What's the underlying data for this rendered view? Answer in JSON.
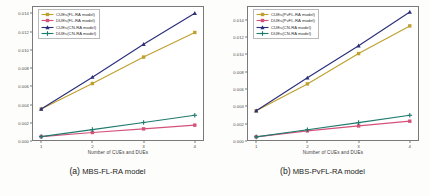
{
  "figure": {
    "background": "#fdfdfb"
  },
  "panels": [
    {
      "caption_tag": "(a)",
      "caption_name": "MBS-FL-RA model",
      "caption_full": "(a) MBS-FL-RA model",
      "chart_data": {
        "type": "line",
        "title": "",
        "xlabel": "Number of CUEs and DUEs",
        "ylabel": "Average Transmission Power (Watt)",
        "x": [
          1,
          2,
          3,
          4
        ],
        "xticklabels": [
          "1",
          "2",
          "3",
          "4"
        ],
        "yticklabels": [
          "0.000",
          "0.002",
          "0.004",
          "0.006",
          "0.008",
          "0.010",
          "0.012",
          "0.014"
        ],
        "ylim": [
          0.0,
          0.0148
        ],
        "xlim": [
          0.82,
          4.18
        ],
        "grid": false,
        "legend_position": "upper left",
        "series": [
          {
            "name": "CUEs(FL-RA model)",
            "values": [
              0.0035,
              0.0063,
              0.0092,
              0.0119
            ],
            "color": "#bfa02e",
            "marker": "square"
          },
          {
            "name": "DUEs(FL-RA model)",
            "values": [
              0.00048,
              0.00093,
              0.00133,
              0.00174
            ],
            "color": "#d4517a",
            "marker": "square"
          },
          {
            "name": "CUEs(CN-RA model)",
            "values": [
              0.0035,
              0.007,
              0.0106,
              0.014
            ],
            "color": "#2b2f7a",
            "marker": "triangle"
          },
          {
            "name": "DUEs(CN-RA model)",
            "values": [
              0.00048,
              0.00125,
              0.00203,
              0.00282
            ],
            "color": "#1f7a6e",
            "marker": "plus"
          }
        ]
      }
    },
    {
      "caption_tag": "(b)",
      "caption_name": "MBS-PvFL-RA model",
      "caption_full": "(b) MBS-PvFL-RA model",
      "chart_data": {
        "type": "line",
        "title": "",
        "xlabel": "Number of CUEs and DUEs",
        "ylabel": "Average Transmission Power (Watt)",
        "x": [
          1,
          2,
          3,
          4
        ],
        "xticklabels": [
          "1",
          "2",
          "3",
          "4"
        ],
        "yticklabels": [
          "0.000",
          "0.002",
          "0.004",
          "0.006",
          "0.008",
          "0.010",
          "0.012",
          "0.014"
        ],
        "ylim": [
          0.0,
          0.0156
        ],
        "xlim": [
          0.82,
          4.18
        ],
        "grid": false,
        "legend_position": "upper left",
        "series": [
          {
            "name": "CUEs(PvFL-RA model)",
            "values": [
              0.0035,
              0.0066,
              0.0101,
              0.0133
            ],
            "color": "#bfa02e",
            "marker": "square"
          },
          {
            "name": "DUEs(PvFL-RA model)",
            "values": [
              0.00048,
              0.00117,
              0.00174,
              0.00229
            ],
            "color": "#d4517a",
            "marker": "square"
          },
          {
            "name": "CUEs(CN-RA model)",
            "values": [
              0.0035,
              0.0073,
              0.011,
              0.0149
            ],
            "color": "#2b2f7a",
            "marker": "triangle"
          },
          {
            "name": "DUEs(CN-RA model)",
            "values": [
              0.00048,
              0.0013,
              0.00212,
              0.00297
            ],
            "color": "#1f7a6e",
            "marker": "plus"
          }
        ]
      }
    }
  ]
}
